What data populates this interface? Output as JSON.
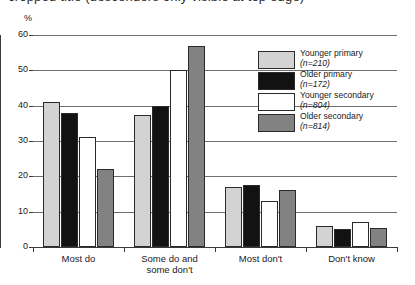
{
  "title": "cropped title (descenders only visible at top edge)",
  "axis": {
    "y_unit": "%",
    "y_ticks": [
      "0",
      "10",
      "20",
      "30",
      "40",
      "50",
      "60"
    ]
  },
  "legend": {
    "entries": [
      {
        "label": "Younger primary",
        "n_text": "(n=210)",
        "n": 210,
        "swatch": "younger-primary",
        "color": "#d3d3d3"
      },
      {
        "label": "Older primary",
        "n_text": "(n=172)",
        "n": 172,
        "swatch": "older-primary",
        "color": "#121212"
      },
      {
        "label": "Younger secondary",
        "n_text": "(n=804)",
        "n": 804,
        "swatch": "younger-secondary",
        "color": "#ffffff"
      },
      {
        "label": "Older secondary",
        "n_text": "(n=814)",
        "n": 814,
        "swatch": "older-secondary",
        "color": "#828282"
      }
    ]
  },
  "categories": [
    {
      "line1": "Most do",
      "line2": ""
    },
    {
      "line1": "Some do and",
      "line2": "some don't"
    },
    {
      "line1": "Most don't",
      "line2": ""
    },
    {
      "line1": "Don't know",
      "line2": ""
    }
  ],
  "chart_data": {
    "type": "bar",
    "title": "",
    "xlabel": "",
    "ylabel": "%",
    "ylim": [
      0,
      60
    ],
    "grid": true,
    "legend_position": "right-inside",
    "categories": [
      "Most do",
      "Some do and some don't",
      "Most don't",
      "Don't know"
    ],
    "series": [
      {
        "name": "Younger primary",
        "n": 210,
        "color": "#d3d3d3",
        "values": [
          41,
          37.5,
          17,
          6
        ]
      },
      {
        "name": "Older primary",
        "n": 172,
        "color": "#121212",
        "values": [
          38,
          40,
          17.5,
          5
        ]
      },
      {
        "name": "Younger secondary",
        "n": 804,
        "color": "#ffffff",
        "values": [
          31,
          50,
          13,
          7
        ]
      },
      {
        "name": "Older secondary",
        "n": 814,
        "color": "#828282",
        "values": [
          22,
          57,
          16,
          5.5
        ]
      }
    ]
  }
}
